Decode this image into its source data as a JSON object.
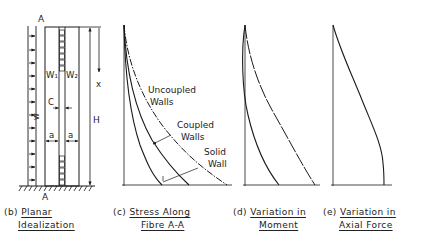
{
  "figure": {
    "panels": [
      {
        "id": "b",
        "label": "(b)",
        "title_line1": "Planar",
        "title_line2": "Idealization",
        "annotations": {
          "section_top": "A",
          "section_bottom": "A",
          "wall_left": "W₁",
          "wall_right": "W₂",
          "connection": "C",
          "load": "w",
          "width_left": "a",
          "width_right": "a",
          "height": "H",
          "depth": "x"
        }
      },
      {
        "id": "c",
        "label": "(c)",
        "title_line1": "Stress Along",
        "title_line2": "Fibre A-A",
        "curves": [
          {
            "name": "Uncoupled Walls",
            "label_line1": "Uncoupled",
            "label_line2": "Walls",
            "style": "dash-dot"
          },
          {
            "name": "Coupled Walls",
            "label_line1": "Coupled",
            "label_line2": "Walls",
            "style": "solid"
          },
          {
            "name": "Solid Wall",
            "label_line1": "Solid",
            "label_line2": "Wall",
            "style": "solid"
          }
        ]
      },
      {
        "id": "d",
        "label": "(d)",
        "title_line1": "Variation in",
        "title_line2": "Moment"
      },
      {
        "id": "e",
        "label": "(e)",
        "title_line1": "Variation in",
        "title_line2": "Axial Force"
      }
    ]
  },
  "colors": {
    "ink": "#1a1a1a",
    "background": "#ffffff"
  }
}
